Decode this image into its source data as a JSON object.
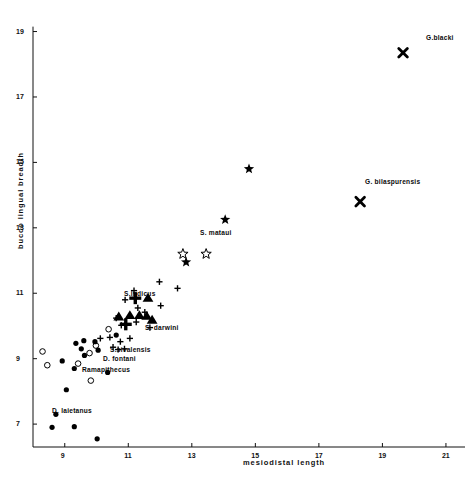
{
  "chart_data": {
    "type": "scatter",
    "title": "",
    "xlabel": "mesiodistal  length",
    "ylabel": "bucco lingual  breadth",
    "xlim": [
      8.0,
      21.6
    ],
    "ylim": [
      6.3,
      19.2
    ],
    "xticks": [
      "9",
      "11",
      "13",
      "15",
      "17",
      "19",
      "21"
    ],
    "xtick_values": [
      9,
      11,
      13,
      15,
      17,
      19,
      21
    ],
    "yticks": [
      "7",
      "9",
      "11",
      "13",
      "15",
      "17",
      "19"
    ],
    "ytick_values": [
      7,
      9,
      11,
      13,
      15,
      17,
      19
    ],
    "grid": false,
    "legend": "none",
    "axis_color": "#111111",
    "marker_color": "#000000",
    "series": [
      {
        "name": "filled-circle",
        "marker": "filled-circle",
        "points": [
          [
            8.92,
            8.93
          ],
          [
            9.35,
            9.47
          ],
          [
            9.52,
            9.3
          ],
          [
            9.6,
            9.55
          ],
          [
            9.62,
            9.1
          ],
          [
            9.95,
            9.52
          ],
          [
            10.05,
            9.26
          ],
          [
            9.3,
            8.7
          ],
          [
            9.05,
            8.05
          ],
          [
            10.35,
            8.58
          ],
          [
            8.72,
            7.3
          ],
          [
            9.3,
            6.92
          ],
          [
            8.6,
            6.9
          ],
          [
            10.02,
            6.55
          ],
          [
            10.62,
            9.72
          ]
        ]
      },
      {
        "name": "open-circle",
        "marker": "open-circle",
        "points": [
          [
            8.3,
            9.22
          ],
          [
            9.42,
            8.85
          ],
          [
            9.78,
            9.17
          ],
          [
            9.98,
            9.4
          ],
          [
            10.38,
            9.9
          ],
          [
            9.82,
            8.33
          ],
          [
            8.45,
            8.8
          ]
        ]
      },
      {
        "name": "plus",
        "marker": "plus",
        "points": [
          [
            10.12,
            9.62
          ],
          [
            10.42,
            9.65
          ],
          [
            10.52,
            9.35
          ],
          [
            10.68,
            9.28
          ],
          [
            10.88,
            9.3
          ],
          [
            11.05,
            9.62
          ],
          [
            10.75,
            9.52
          ],
          [
            10.78,
            10.02
          ],
          [
            11.25,
            10.12
          ],
          [
            11.3,
            10.55
          ],
          [
            11.52,
            10.42
          ],
          [
            11.18,
            11.08
          ],
          [
            12.02,
            10.62
          ],
          [
            12.55,
            11.15
          ],
          [
            11.98,
            11.35
          ],
          [
            10.9,
            10.8
          ],
          [
            10.62,
            10.24
          ],
          [
            11.68,
            9.95
          ]
        ]
      },
      {
        "name": "bold-plus",
        "marker": "bold-plus",
        "points": [
          [
            11.22,
            10.85
          ],
          [
            10.92,
            10.05
          ]
        ]
      },
      {
        "name": "filled-triangle",
        "marker": "filled-triangle",
        "points": [
          [
            11.62,
            10.85
          ],
          [
            11.05,
            10.32
          ],
          [
            11.35,
            10.32
          ],
          [
            11.58,
            10.3
          ],
          [
            11.75,
            10.18
          ],
          [
            10.7,
            10.28
          ]
        ]
      },
      {
        "name": "filled-star",
        "marker": "filled-star",
        "points": [
          [
            12.82,
            11.95
          ],
          [
            14.8,
            14.8
          ],
          [
            14.05,
            13.25
          ]
        ]
      },
      {
        "name": "open-star",
        "marker": "open-star",
        "points": [
          [
            13.45,
            12.2
          ],
          [
            12.72,
            12.2
          ]
        ]
      },
      {
        "name": "bold-x",
        "marker": "bold-x",
        "points": [
          [
            19.65,
            18.35
          ],
          [
            18.3,
            13.8
          ]
        ]
      }
    ],
    "annotations": [
      {
        "text": "G.blacki",
        "x": 426,
        "y": 34,
        "anchor": "left"
      },
      {
        "text": "G. bilaspurensis",
        "x": 365,
        "y": 178,
        "anchor": "left"
      },
      {
        "text": "S. mataui",
        "x": 200,
        "y": 229,
        "anchor": "left"
      },
      {
        "text": "S.indicus",
        "x": 124,
        "y": 290,
        "anchor": "left"
      },
      {
        "text": "S. darwini",
        "x": 145,
        "y": 324,
        "anchor": "left"
      },
      {
        "text": "S.sivalensis",
        "x": 110,
        "y": 346,
        "anchor": "left"
      },
      {
        "text": "D. fontani",
        "x": 103,
        "y": 355,
        "anchor": "left"
      },
      {
        "text": "Ramapithecus",
        "x": 82,
        "y": 366,
        "anchor": "left"
      },
      {
        "text": "D. laietanus",
        "x": 52,
        "y": 407,
        "anchor": "left"
      }
    ]
  }
}
